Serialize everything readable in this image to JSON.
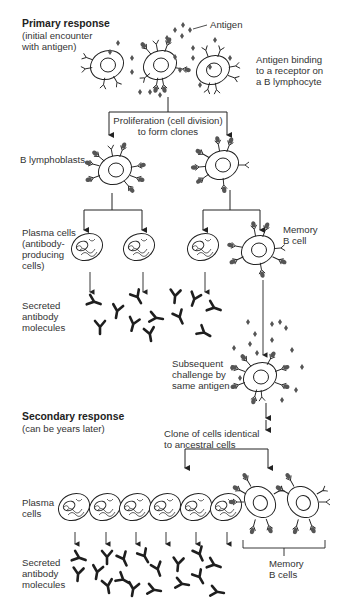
{
  "colors": {
    "line": "#222222",
    "antigen": "#555555",
    "antibody": "#1e1e1e",
    "background": "#ffffff"
  },
  "labels": {
    "primary_heading": "Primary response",
    "primary_sub": "(initial encounter\nwith antigen)",
    "antigen": "Antigen",
    "antigen_binding": "Antigen binding\nto a receptor on\na B lymphocyte",
    "proliferation": "Proliferation (cell division)\nto form clones",
    "b_lymphoblasts": "B lymphoblasts",
    "plasma_cells_1": "Plasma cells\n(antibody-\nproducing\ncells)",
    "memory_b_cell": "Memory\nB cell",
    "secreted_antibody_1": "Secreted\nantibody\nmolecules",
    "subsequent_challenge": "Subsequent\nchallenge by\nsame antigen",
    "secondary_heading": "Secondary response",
    "secondary_sub": "(can be years later)",
    "clone_identical": "Clone of cells identical\nto ancestral cells",
    "plasma_cells_2": "Plasma\ncells",
    "secreted_antibody_2": "Secreted\nantibody\nmolecules",
    "memory_b_cells": "Memory\nB cells"
  }
}
